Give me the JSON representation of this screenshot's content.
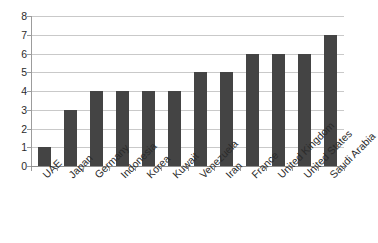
{
  "chart_data": {
    "type": "bar",
    "title": "",
    "xlabel": "",
    "ylabel": "",
    "ylim": [
      0,
      8
    ],
    "yticks": [
      "0",
      "1",
      "2",
      "3",
      "4",
      "5",
      "6",
      "7",
      "8"
    ],
    "grid": true,
    "legend": "none",
    "bar_color": "#444444",
    "gridline_color": "#c9c9c9",
    "axis_color": "#9c9c9c",
    "categories": [
      "UAE",
      "Japan",
      "Germany",
      "Indonesia",
      "Korea",
      "Kuwait",
      "Venezuela",
      "Iran",
      "France",
      "United Kingdom",
      "United States",
      "Saudi Arabia"
    ],
    "values": [
      1,
      3,
      4,
      4,
      4,
      4,
      5,
      5,
      6,
      6,
      6,
      7
    ]
  }
}
